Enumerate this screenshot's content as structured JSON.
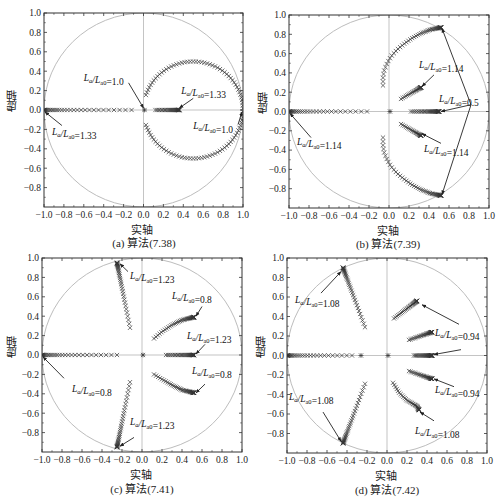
{
  "figure": {
    "colors": {
      "axis": "#333333",
      "circle": "#bdbdbd",
      "marker": "#333333",
      "arrow": "#222222",
      "zero_line": "#aaaaaa"
    }
  },
  "chart_data": [
    {
      "id": "a",
      "type": "scatter",
      "title": "(a) 算法(7.38)",
      "xlabel": "实轴",
      "ylabel": "虚轴",
      "xlim": [
        -1.0,
        1.0
      ],
      "ylim": [
        -1.0,
        1.0
      ],
      "xticks": [
        "-1.0",
        "-0.8",
        "-0.6",
        "-0.4",
        "-0.2",
        "0.0",
        "0.2",
        "0.4",
        "0.6",
        "0.8",
        "1.0"
      ],
      "yticks": [
        "-0.8",
        "-0.6",
        "-0.4",
        "-0.2",
        "0.0",
        "0.2",
        "0.4",
        "0.6",
        "0.8",
        "1.0"
      ],
      "unit_circle": true,
      "frame": {
        "x": 44,
        "y": 13,
        "w": 199,
        "h": 194
      },
      "series": [
        {
          "name": "real-negative",
          "kind": "line-points",
          "from": [
            -1.0,
            0.0
          ],
          "to": [
            -0.12,
            0.0
          ],
          "n": 32,
          "cluster": "start"
        },
        {
          "name": "origin",
          "kind": "point",
          "at": [
            0.01,
            0.0
          ]
        },
        {
          "name": "real-positive",
          "kind": "line-points",
          "from": [
            0.12,
            0.0
          ],
          "to": [
            0.36,
            0.0
          ],
          "n": 30,
          "cluster": "end"
        },
        {
          "name": "upper-arc",
          "kind": "arc",
          "center": [
            0.5,
            0.0
          ],
          "r": 0.5,
          "theta_from": 162,
          "theta_to": 2,
          "n": 50
        },
        {
          "name": "lower-arc",
          "kind": "arc",
          "center": [
            0.5,
            0.0
          ],
          "r": 0.5,
          "theta_from": -162,
          "theta_to": -2,
          "n": 50
        }
      ],
      "annotations": [
        {
          "text_pre": "L",
          "sub1": "a",
          "mid": "/L",
          "sub2": "a0",
          "value": "=1.0",
          "tx": -0.6,
          "ty": 0.3,
          "ax": -0.15,
          "ay": 0.28,
          "hx": 0.0,
          "hy": 0.02
        },
        {
          "text_pre": "L",
          "sub1": "a",
          "mid": "/L",
          "sub2": "a0",
          "value": "=1.33",
          "tx": 0.38,
          "ty": 0.17,
          "ax": 0.5,
          "ay": 0.12,
          "hx": 0.36,
          "hy": 0.02
        },
        {
          "text_pre": "L",
          "sub1": "a",
          "mid": "/L",
          "sub2": "a0",
          "value": "=1.33",
          "tx": -0.92,
          "ty": -0.26,
          "ax": -0.82,
          "ay": -0.16,
          "hx": -0.99,
          "hy": -0.02
        },
        {
          "text_pre": "L",
          "sub1": "a",
          "mid": "/L",
          "sub2": "a0",
          "value": "=1.0",
          "tx": 0.5,
          "ty": -0.2,
          "ax": 0.95,
          "ay": -0.15,
          "hx": 0.99,
          "hy": -0.02
        }
      ]
    },
    {
      "id": "b",
      "type": "scatter",
      "title": "(b) 算法(7.39)",
      "xlabel": "实轴",
      "ylabel": "虚轴",
      "xlim": [
        -1.0,
        1.0
      ],
      "ylim": [
        -1.0,
        1.0
      ],
      "xticks": [
        "-1.0",
        "-0.8",
        "-0.6",
        "-0.4",
        "-0.2",
        "0.0",
        "0.2",
        "0.4",
        "0.6",
        "0.8",
        "1.0"
      ],
      "yticks": [
        "-0.8",
        "-0.6",
        "-0.4",
        "-0.2",
        "0.0",
        "0.2",
        "0.4",
        "0.6",
        "0.8",
        "1.0"
      ],
      "unit_circle": true,
      "frame": {
        "x": 289,
        "y": 15,
        "w": 200,
        "h": 193
      },
      "series": [
        {
          "name": "real-negative",
          "kind": "line-points",
          "from": [
            -1.0,
            0.0
          ],
          "to": [
            -0.22,
            0.0
          ],
          "n": 30,
          "cluster": "start"
        },
        {
          "name": "origin",
          "kind": "point",
          "at": [
            0.01,
            0.0
          ]
        },
        {
          "name": "real-positive",
          "kind": "line-points",
          "from": [
            0.22,
            0.0
          ],
          "to": [
            0.5,
            0.0
          ],
          "n": 32,
          "cluster": "end"
        },
        {
          "name": "upper-curve",
          "kind": "polyline-points",
          "pts": [
            [
              -0.06,
              0.27
            ],
            [
              -0.06,
              0.35
            ],
            [
              -0.05,
              0.42
            ],
            [
              -0.02,
              0.5
            ],
            [
              0.02,
              0.57
            ],
            [
              0.08,
              0.64
            ],
            [
              0.15,
              0.7
            ],
            [
              0.23,
              0.76
            ],
            [
              0.32,
              0.81
            ],
            [
              0.42,
              0.85
            ],
            [
              0.52,
              0.87
            ]
          ],
          "n": 50,
          "cluster": "end"
        },
        {
          "name": "lower-curve",
          "kind": "polyline-points",
          "pts": [
            [
              -0.06,
              -0.27
            ],
            [
              -0.06,
              -0.35
            ],
            [
              -0.05,
              -0.42
            ],
            [
              -0.02,
              -0.5
            ],
            [
              0.02,
              -0.57
            ],
            [
              0.08,
              -0.64
            ],
            [
              0.15,
              -0.7
            ],
            [
              0.23,
              -0.76
            ],
            [
              0.32,
              -0.81
            ],
            [
              0.42,
              -0.85
            ],
            [
              0.52,
              -0.87
            ]
          ],
          "n": 50,
          "cluster": "end"
        },
        {
          "name": "upper-inner",
          "kind": "line-points",
          "from": [
            0.12,
            0.13
          ],
          "to": [
            0.32,
            0.25
          ],
          "n": 26,
          "cluster": "end"
        },
        {
          "name": "lower-inner",
          "kind": "line-points",
          "from": [
            0.12,
            -0.13
          ],
          "to": [
            0.32,
            -0.25
          ],
          "n": 26,
          "cluster": "end"
        }
      ],
      "annotations": [
        {
          "text_pre": "L",
          "sub1": "a",
          "mid": "/L",
          "sub2": "a0",
          "value": "=1.14",
          "tx": 0.3,
          "ty": 0.45,
          "ax": 0.45,
          "ay": 0.38,
          "hx": 0.33,
          "hy": 0.26
        },
        {
          "text_pre": "L",
          "sub1": "a",
          "mid": "/L",
          "sub2": "a0",
          "value": "=0.5",
          "tx": 0.5,
          "ty": 0.1,
          "ax": 0.82,
          "ay": 0.07,
          "hx": 0.52,
          "hy": 0.0
        },
        {
          "text_pre": "L",
          "sub1": "a",
          "mid": "/L",
          "sub2": "a0",
          "value": "=1.14",
          "tx": -0.92,
          "ty": -0.35,
          "ax": -0.78,
          "ay": -0.27,
          "hx": -0.99,
          "hy": -0.02
        },
        {
          "text_pre": "L",
          "sub1": "a",
          "mid": "/L",
          "sub2": "a0",
          "value": "=1.14",
          "tx": 0.35,
          "ty": -0.42,
          "ax": 0.52,
          "ay": -0.33,
          "hx": 0.33,
          "hy": -0.23
        }
      ],
      "extra_arrows": [
        {
          "ax": 0.82,
          "ay": 0.07,
          "hx": 0.53,
          "hy": 0.86
        },
        {
          "ax": 0.82,
          "ay": 0.07,
          "hx": 0.53,
          "hy": -0.86
        }
      ]
    },
    {
      "id": "c",
      "type": "scatter",
      "title": "(c) 算法(7.41)",
      "xlabel": "实轴",
      "ylabel": "虚轴",
      "xlim": [
        -1.0,
        1.0
      ],
      "ylim": [
        -1.0,
        1.0
      ],
      "xticks": [
        "-1.0",
        "-0.8",
        "-0.6",
        "-0.4",
        "-0.2",
        "0.0",
        "0.2",
        "0.4",
        "0.6",
        "0.8",
        "1.0"
      ],
      "yticks": [
        "-0.8",
        "-0.6",
        "-0.4",
        "-0.2",
        "0.0",
        "0.2",
        "0.4",
        "0.6",
        "0.8",
        "1.0"
      ],
      "unit_circle": true,
      "frame": {
        "x": 42,
        "y": 258,
        "w": 200,
        "h": 194
      },
      "series": [
        {
          "name": "real-negative",
          "kind": "line-points",
          "from": [
            -1.0,
            0.0
          ],
          "to": [
            -0.25,
            0.0
          ],
          "n": 30,
          "cluster": "start"
        },
        {
          "name": "origin",
          "kind": "point",
          "at": [
            0.01,
            0.0
          ]
        },
        {
          "name": "real-positive",
          "kind": "line-points",
          "from": [
            0.24,
            0.0
          ],
          "to": [
            0.52,
            0.0
          ],
          "n": 32,
          "cluster": "end"
        },
        {
          "name": "upper-steep",
          "kind": "line-points",
          "from": [
            -0.12,
            0.28
          ],
          "to": [
            -0.25,
            0.95
          ],
          "n": 36,
          "cluster": "end"
        },
        {
          "name": "lower-steep",
          "kind": "line-points",
          "from": [
            -0.12,
            -0.28
          ],
          "to": [
            -0.25,
            -0.95
          ],
          "n": 36,
          "cluster": "end"
        },
        {
          "name": "upper-arc",
          "kind": "polyline-points",
          "pts": [
            [
              0.12,
              0.17
            ],
            [
              0.2,
              0.24
            ],
            [
              0.3,
              0.31
            ],
            [
              0.4,
              0.36
            ],
            [
              0.52,
              0.39
            ]
          ],
          "n": 40,
          "cluster": "end"
        },
        {
          "name": "lower-arc",
          "kind": "polyline-points",
          "pts": [
            [
              0.12,
              -0.2
            ],
            [
              0.2,
              -0.25
            ],
            [
              0.3,
              -0.31
            ],
            [
              0.4,
              -0.36
            ],
            [
              0.52,
              -0.39
            ]
          ],
          "n": 40,
          "cluster": "end"
        }
      ],
      "annotations": [
        {
          "text_pre": "L",
          "sub1": "a",
          "mid": "/L",
          "sub2": "a0",
          "value": "=1.23",
          "tx": -0.12,
          "ty": 0.78,
          "ax": -0.14,
          "ay": 0.86,
          "hx": -0.22,
          "hy": 0.94
        },
        {
          "text_pre": "L",
          "sub1": "a",
          "mid": "/L",
          "sub2": "a0",
          "value": "=0.8",
          "tx": 0.3,
          "ty": 0.58,
          "ax": 0.6,
          "ay": 0.5,
          "hx": 0.54,
          "hy": 0.4
        },
        {
          "text_pre": "L",
          "sub1": "a",
          "mid": "/L",
          "sub2": "a0",
          "value": "=1.23",
          "tx": 0.45,
          "ty": 0.17,
          "ax": 0.63,
          "ay": 0.11,
          "hx": 0.54,
          "hy": 0.01
        },
        {
          "text_pre": "L",
          "sub1": "a",
          "mid": "/L",
          "sub2": "a0",
          "value": "=0.8",
          "tx": -0.7,
          "ty": -0.38,
          "ax": -0.78,
          "ay": -0.24,
          "hx": -0.99,
          "hy": -0.02
        },
        {
          "text_pre": "L",
          "sub1": "a",
          "mid": "/L",
          "sub2": "a0",
          "value": "=0.8",
          "tx": 0.5,
          "ty": -0.2,
          "ax": 0.63,
          "ay": -0.3,
          "hx": 0.54,
          "hy": -0.39
        },
        {
          "text_pre": "L",
          "sub1": "a",
          "mid": "/L",
          "sub2": "a0",
          "value": "=1.23",
          "tx": -0.12,
          "ty": -0.72,
          "ax": -0.08,
          "ay": -0.85,
          "hx": -0.22,
          "hy": -0.94
        }
      ]
    },
    {
      "id": "d",
      "type": "scatter",
      "title": "(d) 算法(7.42)",
      "xlabel": "实轴",
      "ylabel": "虚轴",
      "xlim": [
        -1.0,
        1.0
      ],
      "ylim": [
        -1.0,
        1.0
      ],
      "xticks": [
        "-1.0",
        "-0.8",
        "-0.6",
        "-0.4",
        "-0.2",
        "0.0",
        "0.2",
        "0.4",
        "0.6",
        "0.8",
        "1.0"
      ],
      "yticks": [
        "-0.8",
        "-0.6",
        "-0.4",
        "-0.2",
        "0.0",
        "0.2",
        "0.4",
        "0.6",
        "0.8",
        "1.0"
      ],
      "unit_circle": true,
      "frame": {
        "x": 287,
        "y": 258,
        "w": 200,
        "h": 195
      },
      "series": [
        {
          "name": "real-negative",
          "kind": "line-points",
          "from": [
            -1.0,
            0.0
          ],
          "to": [
            -0.35,
            0.0
          ],
          "n": 28,
          "cluster": "start"
        },
        {
          "name": "real-neg-gap",
          "kind": "point",
          "at": [
            -0.26,
            0.0
          ]
        },
        {
          "name": "origin",
          "kind": "point",
          "at": [
            0.01,
            0.0
          ]
        },
        {
          "name": "real-positive",
          "kind": "line-points",
          "from": [
            0.27,
            0.0
          ],
          "to": [
            0.45,
            0.0
          ],
          "n": 30,
          "cluster": "end"
        },
        {
          "name": "upper-steep",
          "kind": "line-points",
          "from": [
            -0.22,
            0.29
          ],
          "to": [
            -0.44,
            0.9
          ],
          "n": 38,
          "cluster": "end"
        },
        {
          "name": "lower-steep",
          "kind": "line-points",
          "from": [
            -0.22,
            -0.29
          ],
          "to": [
            -0.44,
            -0.9
          ],
          "n": 38,
          "cluster": "end"
        },
        {
          "name": "upper-outer",
          "kind": "line-points",
          "from": [
            0.07,
            0.38
          ],
          "to": [
            0.3,
            0.56
          ],
          "n": 34,
          "cluster": "end"
        },
        {
          "name": "upper-inner",
          "kind": "line-points",
          "from": [
            0.22,
            0.16
          ],
          "to": [
            0.45,
            0.24
          ],
          "n": 30,
          "cluster": "end"
        },
        {
          "name": "lower-inner",
          "kind": "line-points",
          "from": [
            0.22,
            -0.16
          ],
          "to": [
            0.45,
            -0.24
          ],
          "n": 30,
          "cluster": "end"
        },
        {
          "name": "lower-outer",
          "kind": "polyline-points",
          "pts": [
            [
              0.06,
              -0.28
            ],
            [
              0.12,
              -0.38
            ],
            [
              0.2,
              -0.46
            ],
            [
              0.3,
              -0.52
            ],
            [
              0.32,
              -0.56
            ]
          ],
          "n": 34,
          "cluster": "end"
        }
      ],
      "annotations": [
        {
          "text_pre": "L",
          "sub1": "a",
          "mid": "/L",
          "sub2": "a0",
          "value": "=1.08",
          "tx": -0.92,
          "ty": 0.54,
          "ax": -0.66,
          "ay": 0.64,
          "hx": -0.46,
          "hy": 0.86
        },
        {
          "text_pre": "L",
          "sub1": "a",
          "mid": "/L",
          "sub2": "a0",
          "value": "=0.94",
          "tx": 0.48,
          "ty": 0.2,
          "ax": 0.72,
          "ay": 0.32,
          "hx": 0.35,
          "hy": 0.52
        },
        {
          "text_pre": "L",
          "sub1": "a",
          "mid": "/L",
          "sub2": "a0",
          "value": "=1.08",
          "tx": -0.98,
          "ty": -0.46,
          "ax": -0.64,
          "ay": -0.58,
          "hx": -0.46,
          "hy": -0.88
        },
        {
          "text_pre": "L",
          "sub1": "a",
          "mid": "/L",
          "sub2": "a0",
          "value": "=0.94",
          "tx": 0.48,
          "ty": -0.38,
          "ax": 0.67,
          "ay": -0.32,
          "hx": 0.47,
          "hy": -0.24
        },
        {
          "text_pre": "L",
          "sub1": "a",
          "mid": "/L",
          "sub2": "a0",
          "value": "=1.08",
          "tx": 0.28,
          "ty": -0.8,
          "ax": 0.47,
          "ay": -0.67,
          "hx": 0.33,
          "hy": -0.58
        }
      ],
      "extra_arrows": [
        {
          "ax": 0.74,
          "ay": 0.06,
          "hx": 0.47,
          "hy": 0.01
        }
      ]
    }
  ],
  "captions": {
    "a": "(a) 算法(7.38)",
    "b": "(b) 算法(7.39)",
    "c": "(c) 算法(7.41)",
    "d": "(d) 算法(7.42)"
  },
  "axis_labels": {
    "x": "实轴",
    "y": "虚轴"
  }
}
